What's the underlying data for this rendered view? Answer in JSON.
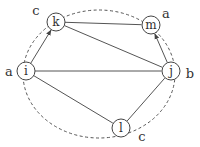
{
  "diagram": {
    "type": "graph",
    "boundary": {
      "style": "dashed-ellipse",
      "cx": 99,
      "cy": 74,
      "rx": 76,
      "ry": 64
    },
    "nodes": [
      {
        "id": "k",
        "label": "k",
        "x": 56,
        "y": 22,
        "color_label": "c",
        "color_label_x": 36,
        "color_label_y": 15
      },
      {
        "id": "m",
        "label": "m",
        "x": 151,
        "y": 25,
        "color_label": "a",
        "color_label_x": 166,
        "color_label_y": 18
      },
      {
        "id": "i",
        "label": "i",
        "x": 26,
        "y": 71,
        "color_label": "a",
        "color_label_x": 9,
        "color_label_y": 76
      },
      {
        "id": "j",
        "label": "j",
        "x": 171,
        "y": 71,
        "color_label": "b",
        "color_label_x": 190,
        "color_label_y": 78
      },
      {
        "id": "l",
        "label": "l",
        "x": 121,
        "y": 128,
        "color_label": "c",
        "color_label_x": 142,
        "color_label_y": 141
      }
    ],
    "edges": [
      {
        "from": "i",
        "to": "k",
        "directed": true
      },
      {
        "from": "k",
        "to": "m",
        "directed": false
      },
      {
        "from": "k",
        "to": "j",
        "directed": false
      },
      {
        "from": "i",
        "to": "j",
        "directed": false
      },
      {
        "from": "i",
        "to": "l",
        "directed": false
      },
      {
        "from": "l",
        "to": "j",
        "directed": false
      },
      {
        "from": "j",
        "to": "m",
        "directed": true
      }
    ],
    "node_radius": 9
  }
}
